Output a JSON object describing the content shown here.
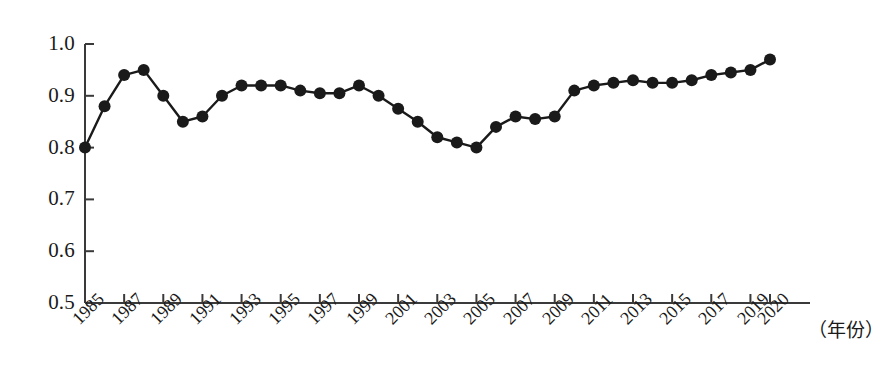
{
  "chart_data": {
    "type": "line",
    "title": "",
    "subtitle": "",
    "xlabel": "（年份）",
    "ylabel": "",
    "grid": false,
    "legend": "none",
    "marker": "filled-circle",
    "line_color": "#1a1a1a",
    "marker_color": "#1a1a1a",
    "xlim": [
      1985,
      2020
    ],
    "ylim": [
      0.5,
      1.0
    ],
    "ytick_labels": [
      "1.0",
      "0.9",
      "0.8",
      "0.7",
      "0.6",
      "0.5"
    ],
    "ytick_values": [
      1.0,
      0.9,
      0.8,
      0.7,
      0.6,
      0.5
    ],
    "xtick_labels": [
      "1985",
      "1987",
      "1989",
      "1991",
      "1993",
      "1995",
      "1997",
      "1999",
      "2001",
      "2003",
      "2005",
      "2007",
      "2009",
      "2011",
      "2013",
      "2015",
      "2017",
      "2019",
      "2020"
    ],
    "xtick_values": [
      1985,
      1987,
      1989,
      1991,
      1993,
      1995,
      1997,
      1999,
      2001,
      2003,
      2005,
      2007,
      2009,
      2011,
      2013,
      2015,
      2017,
      2019,
      2020
    ],
    "x": [
      1985,
      1986,
      1987,
      1988,
      1989,
      1990,
      1991,
      1992,
      1993,
      1994,
      1995,
      1996,
      1997,
      1998,
      1999,
      2000,
      2001,
      2002,
      2003,
      2004,
      2005,
      2006,
      2007,
      2008,
      2009,
      2010,
      2011,
      2012,
      2013,
      2014,
      2015,
      2016,
      2017,
      2018,
      2019,
      2020
    ],
    "values": [
      0.8,
      0.88,
      0.94,
      0.95,
      0.9,
      0.85,
      0.86,
      0.9,
      0.92,
      0.92,
      0.92,
      0.91,
      0.905,
      0.905,
      0.92,
      0.9,
      0.875,
      0.85,
      0.82,
      0.81,
      0.8,
      0.84,
      0.86,
      0.855,
      0.86,
      0.91,
      0.92,
      0.925,
      0.93,
      0.925,
      0.925,
      0.93,
      0.94,
      0.945,
      0.95,
      0.97
    ]
  }
}
